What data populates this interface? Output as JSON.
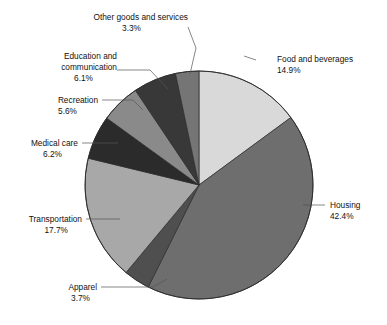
{
  "chart_data": {
    "type": "pie",
    "title": "",
    "subtitle": "",
    "xlabel": "",
    "ylabel": "",
    "legend_position": "none",
    "grid": false,
    "labels_show_percent": true,
    "start_angle_deg": 0,
    "direction": "clockwise",
    "categories": [
      "Food and beverages",
      "Housing",
      "Apparel",
      "Transportation",
      "Medical care",
      "Recreation",
      "Education and communication",
      "Other goods and services"
    ],
    "values": [
      14.9,
      42.4,
      3.7,
      17.7,
      6.2,
      5.6,
      6.1,
      3.3
    ],
    "value_labels": [
      "14.9%",
      "42.4%",
      "3.7%",
      "17.7%",
      "6.2%",
      "5.6%",
      "6.1%",
      "3.3%"
    ],
    "colors": [
      "#d9d9d9",
      "#6e6e6e",
      "#4f4f4f",
      "#a8a8a8",
      "#2b2b2b",
      "#8a8a8a",
      "#383838",
      "#757575"
    ],
    "slices": [
      {
        "name": "Food and beverages",
        "value": 14.9,
        "value_label": "14.9%",
        "color": "#d9d9d9",
        "label_name_x": 277,
        "label_name_y": 62,
        "label_pct_x": 277,
        "label_pct_y": 73,
        "label_anchor": "start",
        "leader": "M 244 56 L 256 60"
      },
      {
        "name": "Housing",
        "value": 42.4,
        "value_label": "42.4%",
        "color": "#6e6e6e",
        "label_name_x": 330,
        "label_name_y": 208,
        "label_pct_x": 330,
        "label_pct_y": 219,
        "label_anchor": "start",
        "leader": "M 303 205 L 325 205"
      },
      {
        "name": "Apparel",
        "value": 3.7,
        "value_label": "3.7%",
        "color": "#4f4f4f",
        "label_name_x": 97,
        "label_name_y": 290,
        "label_pct_x": 97,
        "label_pct_y": 301,
        "label_anchor": "end",
        "leader": "M 101 287 L 153 287 L 167 279"
      },
      {
        "name": "Transportation",
        "value": 17.7,
        "value_label": "17.7%",
        "color": "#a8a8a8",
        "label_name_x": 82,
        "label_name_y": 222,
        "label_pct_x": 82,
        "label_pct_y": 233,
        "label_anchor": "end",
        "leader": "M 86 219 L 120 219"
      },
      {
        "name": "Medical care",
        "value": 6.2,
        "value_label": "6.2%",
        "color": "#2b2b2b",
        "label_name_x": 78,
        "label_name_y": 146,
        "label_pct_x": 78,
        "label_pct_y": 157,
        "label_anchor": "end",
        "leader": "M 82 143 L 118 143"
      },
      {
        "name": "Recreation",
        "value": 5.6,
        "value_label": "5.6%",
        "color": "#8a8a8a",
        "label_name_x": 98,
        "label_name_y": 103,
        "label_pct_x": 98,
        "label_pct_y": 114,
        "label_anchor": "end",
        "leader": "M 102 100 L 133 100 L 143 110"
      },
      {
        "name": "Education and communication",
        "value": 6.1,
        "value_label": "6.1%",
        "color": "#383838",
        "label_name_x": 113,
        "label_name_y": 59,
        "label_name_line2": "communication",
        "label_pct_x": 113,
        "label_pct_y": 81,
        "label_anchor": "end",
        "leader": "M 117 70 L 150 70 L 168 89"
      },
      {
        "name": "Other goods and services",
        "value": 3.3,
        "value_label": "3.3%",
        "color": "#757575",
        "label_name_x": 184,
        "label_name_y": 20,
        "label_pct_x": 184,
        "label_pct_y": 31,
        "label_anchor": "end",
        "leader": "M 188 27 L 196 48 L 190 74"
      }
    ],
    "center": {
      "x": 199,
      "y": 185
    },
    "radius": 114
  },
  "labels": {
    "food": {
      "name": "Food and beverages",
      "pct": "14.9%"
    },
    "housing": {
      "name": "Housing",
      "pct": "42.4%"
    },
    "apparel": {
      "name": "Apparel",
      "pct": "3.7%"
    },
    "transportation": {
      "name": "Transportation",
      "pct": "17.7%"
    },
    "medical": {
      "name": "Medical care",
      "pct": "6.2%"
    },
    "recreation": {
      "name": "Recreation",
      "pct": "5.6%"
    },
    "education": {
      "name": "Education and",
      "name2": "communication",
      "pct": "6.1%"
    },
    "other": {
      "name": "Other goods and services",
      "pct": "3.3%"
    }
  }
}
